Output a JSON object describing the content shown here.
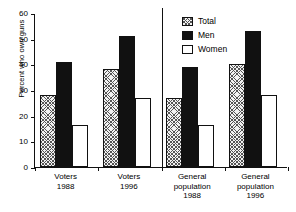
{
  "chart_data": {
    "type": "bar",
    "title": "",
    "xlabel": "",
    "ylabel": "Percent who own guns",
    "ylim": [
      0,
      60
    ],
    "yticks": [
      0,
      10,
      20,
      30,
      40,
      50,
      60
    ],
    "ytick_labels": [
      "0",
      "10",
      "20",
      "30",
      "40",
      "50",
      "60"
    ],
    "grid": false,
    "legend_position": "top-right",
    "categories": [
      "Voters\n1988",
      "Voters\n1996",
      "General\npopulation\n1988",
      "General\npopulation\n1996"
    ],
    "series": [
      {
        "name": "Total",
        "values": [
          28,
          38,
          27,
          40
        ],
        "style": "hatched"
      },
      {
        "name": "Men",
        "values": [
          41,
          51,
          39,
          53
        ],
        "style": "black"
      },
      {
        "name": "Women",
        "values": [
          16.5,
          27,
          16.5,
          28
        ],
        "style": "white"
      }
    ],
    "panel_divider_after_category": 2,
    "colors": {
      "axis": "#111111",
      "total": "#f2f2f2",
      "men": "#111111",
      "women": "#ffffff"
    }
  }
}
